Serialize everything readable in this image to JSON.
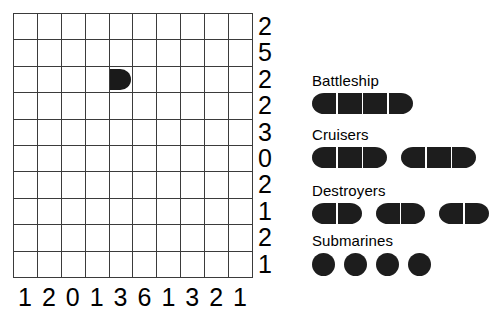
{
  "puzzle": {
    "type": "battleship-solitaire",
    "grid": {
      "rows": 10,
      "cols": 10,
      "row_clues": [
        "2",
        "5",
        "2",
        "2",
        "3",
        "0",
        "2",
        "1",
        "2",
        "1"
      ],
      "col_clues": [
        "1",
        "2",
        "0",
        "1",
        "3",
        "6",
        "1",
        "3",
        "2",
        "1"
      ],
      "placed_pieces": [
        {
          "row": 2,
          "col": 4,
          "shape": "end-right"
        }
      ]
    }
  },
  "fleet": {
    "groups": [
      {
        "label": "Battleship",
        "ships": [
          {
            "segments": 4
          }
        ]
      },
      {
        "label": "Cruisers",
        "ships": [
          {
            "segments": 3
          },
          {
            "segments": 3
          }
        ]
      },
      {
        "label": "Destroyers",
        "ships": [
          {
            "segments": 2
          },
          {
            "segments": 2
          },
          {
            "segments": 2
          }
        ]
      },
      {
        "label": "Submarines",
        "ships": [
          {
            "segments": 1
          },
          {
            "segments": 1
          },
          {
            "segments": 1
          },
          {
            "segments": 1
          }
        ]
      }
    ]
  },
  "colors": {
    "ship": "#1d1d1d",
    "grid_line": "#3b3b3b",
    "background": "#ffffff",
    "text": "#000000"
  }
}
